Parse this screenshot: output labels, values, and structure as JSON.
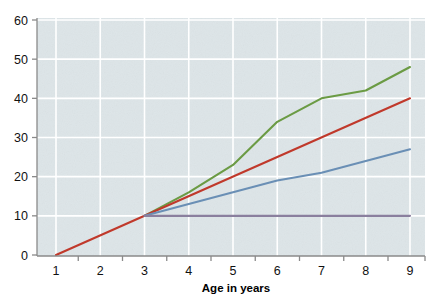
{
  "chart_data": {
    "type": "line",
    "title": "",
    "xlabel": "Age in years",
    "ylabel": "",
    "xlim": [
      0.6,
      9.4
    ],
    "ylim": [
      0,
      60
    ],
    "grid": true,
    "legend": "none",
    "xticks": [
      1,
      2,
      3,
      4,
      5,
      6,
      7,
      8,
      9
    ],
    "xtick_labels": [
      "1",
      "2",
      "3",
      "4",
      "5",
      "6",
      "7",
      "8",
      "9"
    ],
    "yticks": [
      0,
      10,
      20,
      30,
      40,
      50,
      60
    ],
    "ytick_labels": [
      "0",
      "10",
      "20",
      "30",
      "40",
      "50",
      "60"
    ],
    "background_color": "#dde5e8",
    "gridline_color": "#ffffff",
    "axis_color": "#8a8a8a",
    "series": [
      {
        "name": "green",
        "color": "#6b9b44",
        "x": [
          3,
          4,
          5,
          6,
          7,
          8,
          9
        ],
        "values": [
          10,
          16,
          23,
          34,
          40,
          42,
          48
        ]
      },
      {
        "name": "red",
        "color": "#c0392b",
        "x": [
          1,
          3,
          9
        ],
        "values": [
          0,
          10,
          40
        ]
      },
      {
        "name": "blue",
        "color": "#6a8fb5",
        "x": [
          3,
          4,
          5,
          6,
          7,
          8,
          9
        ],
        "values": [
          10,
          13,
          16,
          19,
          21,
          24,
          27
        ]
      },
      {
        "name": "purple",
        "color": "#8a7f9e",
        "x": [
          3,
          9
        ],
        "values": [
          10,
          10
        ]
      }
    ]
  }
}
